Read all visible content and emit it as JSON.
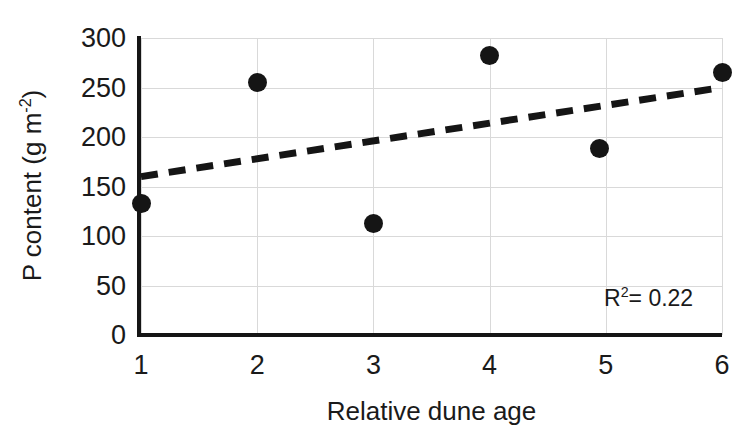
{
  "chart_data": {
    "type": "scatter",
    "title": "",
    "xlabel": "Relative dune age",
    "ylabel": "P content (g m⁻²)",
    "ylabel_parts": {
      "main": "P content (g m",
      "sup": "-2",
      "tail": ")"
    },
    "xlim": [
      1,
      6
    ],
    "ylim": [
      0,
      300
    ],
    "grid": true,
    "legend": null,
    "x": [
      1,
      2,
      3,
      4,
      4.95,
      6
    ],
    "y": [
      133,
      255,
      113,
      282,
      188,
      265
    ],
    "points": [
      {
        "x": 1,
        "y": 133
      },
      {
        "x": 2,
        "y": 255
      },
      {
        "x": 3,
        "y": 113
      },
      {
        "x": 4,
        "y": 282
      },
      {
        "x": 4.95,
        "y": 188
      },
      {
        "x": 6,
        "y": 265
      }
    ],
    "xticks": [
      1,
      2,
      3,
      4,
      5,
      6
    ],
    "xtick_labels": [
      "1",
      "2",
      "3",
      "4",
      "5",
      "6"
    ],
    "yticks": [
      0,
      50,
      100,
      150,
      200,
      250,
      300
    ],
    "ytick_labels": [
      "0",
      "50",
      "100",
      "150",
      "200",
      "250",
      "300"
    ],
    "trendline": {
      "type": "linear-dashed",
      "x_start": 1,
      "y_start": 160,
      "x_end": 6,
      "y_end": 250
    },
    "annotations": [
      {
        "name": "r-squared",
        "text_main": "R",
        "text_sup": "2",
        "text_tail": "= 0.22",
        "value": 0.22
      }
    ],
    "colors": {
      "marker": "#151515",
      "trendline": "#151515",
      "gridline": "#d9d9d9",
      "axis": "#151515",
      "text": "#1a1a1a",
      "background": "#ffffff"
    }
  }
}
